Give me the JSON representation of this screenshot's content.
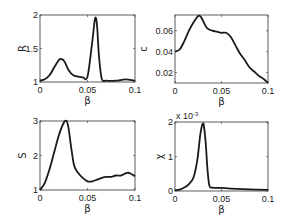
{
  "chart_data": [
    {
      "type": "line",
      "id": "R",
      "ylabel": "R",
      "xlabel": "β",
      "xlim": [
        0,
        0.1
      ],
      "ylim": [
        1,
        2
      ],
      "xticks": [
        "0",
        "0.05",
        "0.1"
      ],
      "yticks": [
        "1",
        "1.5",
        "2"
      ],
      "x": [
        0,
        0.005,
        0.01,
        0.015,
        0.02,
        0.023,
        0.026,
        0.03,
        0.035,
        0.04,
        0.045,
        0.05,
        0.055,
        0.058,
        0.06,
        0.062,
        0.065,
        0.07,
        0.08,
        0.09,
        0.1
      ],
      "values": [
        1.02,
        1.04,
        1.1,
        1.22,
        1.33,
        1.34,
        1.3,
        1.18,
        1.1,
        1.08,
        1.07,
        1.08,
        1.6,
        1.95,
        1.85,
        1.4,
        1.05,
        1.02,
        1.02,
        1.04,
        1.02
      ]
    },
    {
      "type": "line",
      "id": "c",
      "ylabel": "c",
      "xlabel": "β",
      "xlim": [
        0,
        0.1
      ],
      "ylim": [
        0.01,
        0.075
      ],
      "xticks": [
        "0",
        "0.05",
        "0.1"
      ],
      "yticks": [
        "0.02",
        "0.04",
        "0.06"
      ],
      "x": [
        0,
        0.005,
        0.01,
        0.015,
        0.02,
        0.025,
        0.028,
        0.032,
        0.035,
        0.04,
        0.045,
        0.05,
        0.055,
        0.06,
        0.065,
        0.07,
        0.075,
        0.08,
        0.085,
        0.09,
        0.095,
        0.1
      ],
      "values": [
        0.04,
        0.042,
        0.05,
        0.06,
        0.068,
        0.074,
        0.073,
        0.066,
        0.062,
        0.06,
        0.059,
        0.058,
        0.058,
        0.054,
        0.046,
        0.038,
        0.032,
        0.025,
        0.021,
        0.017,
        0.014,
        0.01
      ]
    },
    {
      "type": "line",
      "id": "S",
      "ylabel": "S",
      "xlabel": "β",
      "xlim": [
        0,
        0.1
      ],
      "ylim": [
        1,
        3
      ],
      "xticks": [
        "0",
        "0.05",
        "0.1"
      ],
      "yticks": [
        "1",
        "2",
        "3"
      ],
      "x": [
        0,
        0.005,
        0.01,
        0.015,
        0.02,
        0.025,
        0.028,
        0.03,
        0.033,
        0.036,
        0.04,
        0.045,
        0.05,
        0.055,
        0.06,
        0.065,
        0.07,
        0.075,
        0.08,
        0.085,
        0.09,
        0.093,
        0.097,
        0.1
      ],
      "values": [
        1.0,
        1.2,
        1.6,
        2.1,
        2.6,
        2.95,
        3.0,
        2.8,
        2.2,
        1.7,
        1.5,
        1.35,
        1.25,
        1.25,
        1.3,
        1.35,
        1.38,
        1.38,
        1.42,
        1.42,
        1.48,
        1.5,
        1.45,
        1.4
      ]
    },
    {
      "type": "line",
      "id": "chi",
      "ylabel": "χ",
      "xlabel": "β",
      "xlim": [
        0,
        0.1
      ],
      "ylim": [
        0,
        0.002
      ],
      "scale_note": "x 10^-3",
      "xticks": [
        "0",
        "0.05",
        "0.1"
      ],
      "yticks": [
        "0",
        "1",
        "2"
      ],
      "x": [
        0,
        0.005,
        0.01,
        0.015,
        0.02,
        0.024,
        0.027,
        0.029,
        0.03,
        0.031,
        0.033,
        0.035,
        0.037,
        0.04,
        0.05,
        0.06,
        0.08,
        0.1
      ],
      "values": [
        2e-05,
        4e-05,
        0.0001,
        0.0002,
        0.0004,
        0.0009,
        0.0016,
        0.0019,
        0.00195,
        0.0019,
        0.0014,
        0.0006,
        0.00015,
        0.0001,
        9e-05,
        7e-05,
        5e-05,
        3e-05
      ]
    }
  ],
  "labels": {
    "xlabel": "β",
    "R": "R",
    "c": "c",
    "S": "S",
    "chi": "χ",
    "chi_scale_prefix": "x 10",
    "chi_scale_exp": "-3"
  },
  "colors": {
    "line": "#1a1a1a",
    "axes": "#333333"
  }
}
